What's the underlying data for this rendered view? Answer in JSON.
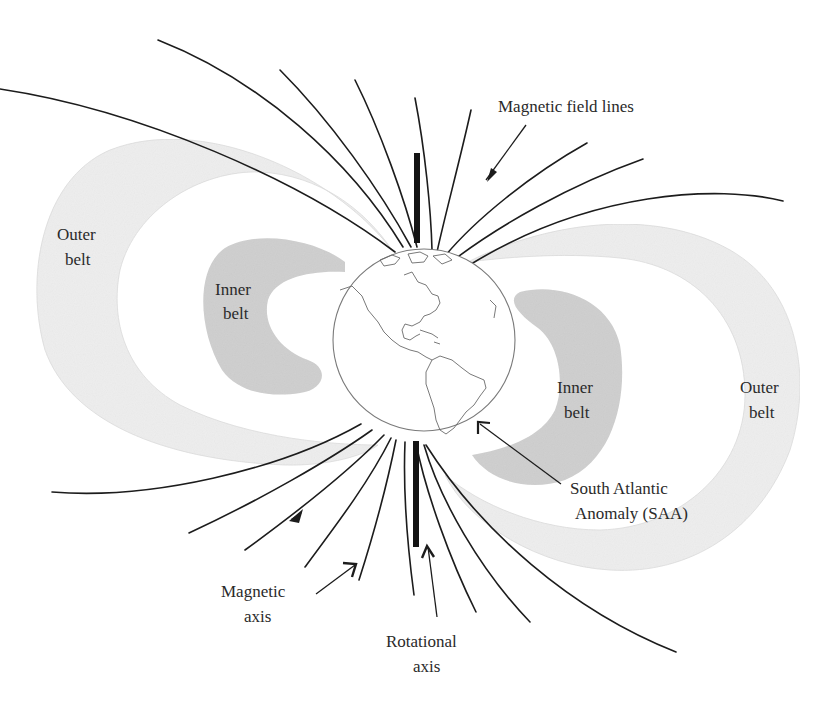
{
  "figure": {
    "labels": {
      "field_lines": "Magnetic field lines",
      "outer_belt_left_1": "Outer",
      "outer_belt_left_2": "belt",
      "inner_belt_left_1": "Inner",
      "inner_belt_left_2": "belt",
      "inner_belt_right_1": "Inner",
      "inner_belt_right_2": "belt",
      "outer_belt_right_1": "Outer",
      "outer_belt_right_2": "belt",
      "saa_1": "South Atlantic",
      "saa_2": "Anomaly (SAA)",
      "magnetic_axis_1": "Magnetic",
      "magnetic_axis_2": "axis",
      "rotational_axis_1": "Rotational",
      "rotational_axis_2": "axis"
    },
    "colors": {
      "background": "#ffffff",
      "outer_belt_fill": "#eeeeee",
      "inner_belt_fill": "#cfcfcf",
      "field_line": "#1c1c1c",
      "axis_bar": "#141414",
      "globe_fill": "#ffffff",
      "coastline": "#6a6a6a"
    }
  }
}
